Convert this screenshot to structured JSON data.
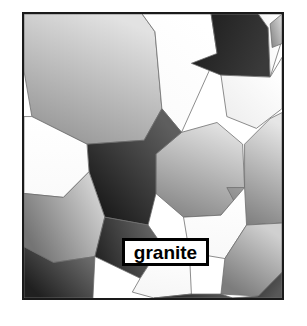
{
  "figure": {
    "kind": "microstructure-diagram",
    "subject": "granite",
    "caption_label": "granite",
    "frame": {
      "border_color": "#1a1a1a",
      "border_width_px": 2,
      "background_color": "#ffffff",
      "x": 22,
      "y": 12,
      "width": 262,
      "height": 288
    },
    "label_box": {
      "text": "granite",
      "text_color": "#000000",
      "background_color": "#ffffff",
      "border_color": "#000000",
      "border_width_px": 3,
      "x": 122,
      "y": 238,
      "width": 87,
      "height": 28
    },
    "page_background": "#ffffff",
    "palette": {
      "grain_dark": "#2b2b2b",
      "grain_mid": "#8c8c8c",
      "grain_light": "#d8d8d8",
      "grain_white": "#ffffff",
      "grain_outline": "#6e6e6e"
    },
    "grains": [
      {
        "name": "grain-top-left-large",
        "points": "0,0 120,0 133,18 140,96 122,128 64,132 8,104 0,58",
        "shade_from": "#e2e2e2",
        "shade_to": "#9a9a9a",
        "angle": 115
      },
      {
        "name": "grain-top-center-white",
        "points": "120,0 190,0 196,40 160,120 140,96 133,18",
        "shade_from": "#ffffff",
        "shade_to": "#fbfbfb",
        "angle": 120
      },
      {
        "name": "grain-top-center-dark",
        "points": "190,0 238,0 248,14 250,64 200,62 170,50 196,40",
        "shade_from": "#3a3a3a",
        "shade_to": "#1f1f1f",
        "angle": 200
      },
      {
        "name": "grain-top-right-wedge",
        "points": "238,0 262,0 262,26 250,64 248,14",
        "shade_from": "#ffffff",
        "shade_to": "#f4f4f4",
        "angle": 160
      },
      {
        "name": "grain-top-right-small",
        "points": "250,10 262,0 262,30 252,34",
        "shade_from": "#cfcfcf",
        "shade_to": "#8e8e8e",
        "angle": 140
      },
      {
        "name": "grain-upper-right-octagon",
        "points": "250,64 262,44 262,96 236,116 206,104 200,62",
        "shade_from": "#ffffff",
        "shade_to": "#efefef",
        "angle": 130
      },
      {
        "name": "grain-center-octagon",
        "points": "160,120 196,110 222,132 224,176 200,204 162,206 134,182 134,142",
        "shade_from": "#e0e0e0",
        "shade_to": "#8b8b8b",
        "angle": 110
      },
      {
        "name": "grain-mid-left-dark",
        "points": "122,128 140,96 160,120 134,142 134,182 126,214 82,206 66,160 64,132",
        "shade_from": "#5e5e5e",
        "shade_to": "#1c1c1c",
        "angle": 135
      },
      {
        "name": "grain-left-white-notch",
        "points": "0,104 8,104 64,132 66,160 40,186 0,182",
        "shade_from": "#ffffff",
        "shade_to": "#fafafa",
        "angle": 90
      },
      {
        "name": "grain-right-large",
        "points": "224,132 250,106 262,100 262,212 226,214 206,176 224,176",
        "shade_from": "#e6e6e6",
        "shade_to": "#808080",
        "angle": 105
      },
      {
        "name": "grain-center-white-pentagon",
        "points": "200,204 224,176 226,214 204,248 168,242 162,206",
        "shade_from": "#ffffff",
        "shade_to": "#f8f8f8",
        "angle": 95
      },
      {
        "name": "grain-left-mid-slab",
        "points": "0,182 40,186 66,160 82,206 72,246 30,252 0,236",
        "shade_from": "#d2d2d2",
        "shade_to": "#747474",
        "angle": 150
      },
      {
        "name": "grain-lower-left-dark-slab",
        "points": "82,206 126,214 140,234 118,268 72,246",
        "shade_from": "#676767",
        "shade_to": "#242424",
        "angle": 160
      },
      {
        "name": "grain-lower-center-white",
        "points": "118,268 140,234 168,242 170,284 132,288 110,282",
        "shade_from": "#ffffff",
        "shade_to": "#f6f6f6",
        "angle": 100
      },
      {
        "name": "grain-lower-right-big",
        "points": "204,248 226,214 262,212 262,262 238,286 200,284",
        "shade_from": "#d0d0d0",
        "shade_to": "#7c7c7c",
        "angle": 120
      },
      {
        "name": "grain-bottom-left-dark",
        "points": "0,236 30,252 72,246 70,288 0,288",
        "shade_from": "#6a6a6a",
        "shade_to": "#202020",
        "angle": 145
      },
      {
        "name": "grain-bottom-center-dark",
        "points": "132,288 170,284 200,284 212,288",
        "shade_from": "#5a5a5a",
        "shade_to": "#1e1e1e",
        "angle": 180
      },
      {
        "name": "grain-bottom-right-dark",
        "points": "238,286 262,262 262,288 212,288",
        "shade_from": "#585858",
        "shade_to": "#1d1d1d",
        "angle": 200
      }
    ]
  }
}
